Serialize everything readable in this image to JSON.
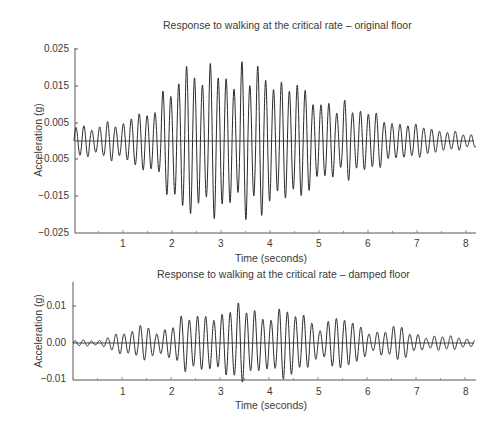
{
  "chart_data": [
    {
      "type": "line",
      "title": "Response to walking at the critical rate – original floor",
      "xlabel": "Time (seconds)",
      "ylabel": "Acceleration (g)",
      "xlim": [
        0,
        8.2
      ],
      "ylim": [
        -0.025,
        0.025
      ],
      "x_ticks": [
        "1",
        "2",
        "3",
        "4",
        "5",
        "6",
        "7",
        "8"
      ],
      "y_ticks": [
        "0.025",
        "0.015",
        "0.005",
        "−0.005",
        "−0.015",
        "−0.025"
      ],
      "grid": false,
      "legend": null,
      "series": [
        {
          "name": "acceleration",
          "description": "oscillatory response (~6 Hz) building from near zero to peak ~0.021 g at ~2.1-2.5 s, then decaying to ~0.002 g by 8 s",
          "envelope_x": [
            0,
            0.5,
            1.0,
            1.5,
            2.0,
            2.2,
            2.5,
            3.0,
            3.5,
            4.0,
            4.5,
            5.0,
            5.5,
            6.0,
            6.5,
            7.0,
            7.5,
            8.0,
            8.2
          ],
          "envelope_peak": [
            0.003,
            0.004,
            0.005,
            0.008,
            0.013,
            0.021,
            0.019,
            0.019,
            0.018,
            0.017,
            0.014,
            0.012,
            0.009,
            0.007,
            0.005,
            0.004,
            0.003,
            0.002,
            0.002
          ]
        }
      ]
    },
    {
      "type": "line",
      "title": "Response to walking at the critical rate – damped floor",
      "xlabel": "Time (seconds)",
      "ylabel": "Acceleration (g)",
      "xlim": [
        0,
        8.2
      ],
      "ylim": [
        -0.01,
        0.017
      ],
      "x_ticks": [
        "1",
        "2",
        "3",
        "4",
        "5",
        "6",
        "7",
        "8"
      ],
      "y_ticks": [
        "0.01",
        "0.00",
        "−0.01"
      ],
      "grid": false,
      "legend": null,
      "series": [
        {
          "name": "acceleration",
          "description": "beating oscillatory response peaking ~0.011 g near 2.8-3.7 s, decaying to ~0.001 g by 8 s",
          "envelope_x": [
            0,
            0.5,
            1.0,
            1.5,
            2.0,
            2.5,
            2.8,
            3.0,
            3.3,
            3.7,
            4.0,
            4.5,
            5.0,
            5.5,
            6.0,
            6.5,
            7.0,
            7.5,
            8.0,
            8.2
          ],
          "envelope_peak": [
            0.0005,
            0.001,
            0.003,
            0.005,
            0.005,
            0.008,
            0.011,
            0.009,
            0.01,
            0.01,
            0.009,
            0.009,
            0.007,
            0.006,
            0.005,
            0.004,
            0.003,
            0.002,
            0.001,
            0.001
          ]
        }
      ]
    }
  ],
  "top": {
    "title": "Response to walking at the critical rate – original floor",
    "ylabel": "Acceleration (g)",
    "xlabel": "Time (seconds)",
    "yticks": [
      "0.025",
      "0.015",
      "0.005",
      "−0.005",
      "−0.015",
      "−0.025"
    ],
    "xticks": [
      "1",
      "2",
      "3",
      "4",
      "5",
      "6",
      "7",
      "8"
    ]
  },
  "bottom": {
    "title": "Response to walking at the critical rate – damped floor",
    "ylabel": "Acceleration (g)",
    "xlabel": "Time (seconds)",
    "yticks": [
      "0.01",
      "0.00",
      "−0.01"
    ],
    "xticks": [
      "1",
      "2",
      "3",
      "4",
      "5",
      "6",
      "7",
      "8"
    ]
  }
}
